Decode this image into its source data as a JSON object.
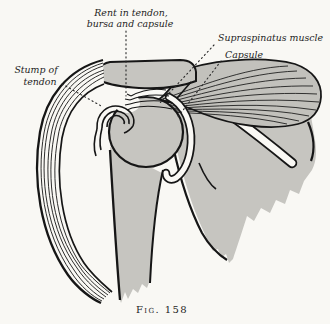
{
  "figure": {
    "caption": "Fig. 158",
    "labels": {
      "rent_line1": "Rent in tendon,",
      "rent_line2": "bursa and capsule",
      "supraspinatus": "Supraspinatus muscle",
      "capsule": "Capsule",
      "stump_line1": "Stump of",
      "stump_line2": "tendon"
    },
    "colors": {
      "ink": "#161616",
      "paper": "#f9f8f4",
      "halftone_gray": "#c6c5c0"
    }
  }
}
